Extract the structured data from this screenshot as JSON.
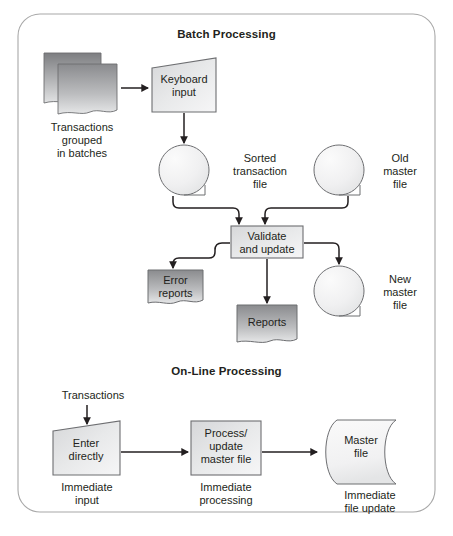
{
  "figure": {
    "frame": {
      "style": "rounded-rectangle-border",
      "border_color": "#a8a8a8"
    },
    "background": "#ffffff"
  },
  "sections": [
    {
      "id": "batch",
      "title": "Batch Processing"
    },
    {
      "id": "online",
      "title": "On-Line Processing"
    }
  ],
  "batch": {
    "transactions_stack": {
      "shape": "stacked-documents",
      "caption_line1": "Transactions",
      "caption_line2": "grouped",
      "caption_line3": "in batches"
    },
    "keyboard_input": {
      "shape": "manual-input-trapezoid",
      "line1": "Keyboard",
      "line2": "input"
    },
    "sorted_transaction_file": {
      "shape": "magnetic-tape",
      "label_line1": "Sorted",
      "label_line2": "transaction",
      "label_line3": "file"
    },
    "old_master_file": {
      "shape": "magnetic-tape",
      "label_line1": "Old",
      "label_line2": "master",
      "label_line3": "file"
    },
    "validate_and_update": {
      "shape": "process-rectangle",
      "line1": "Validate",
      "line2": "and update"
    },
    "error_reports": {
      "shape": "document",
      "line1": "Error",
      "line2": "reports"
    },
    "reports": {
      "shape": "document",
      "line1": "Reports"
    },
    "new_master_file": {
      "shape": "magnetic-tape",
      "label_line1": "New",
      "label_line2": "master",
      "label_line3": "file"
    }
  },
  "online": {
    "transactions_label": "Transactions",
    "enter_directly": {
      "shape": "manual-input-trapezoid",
      "line1": "Enter",
      "line2": "directly",
      "caption_line1": "Immediate",
      "caption_line2": "input"
    },
    "process_update": {
      "shape": "process-rectangle",
      "line1": "Process/",
      "line2": "update",
      "line3": "master file",
      "caption_line1": "Immediate",
      "caption_line2": "processing"
    },
    "master_file": {
      "shape": "direct-access-storage",
      "line1": "Master",
      "line2": "file",
      "caption_line1": "Immediate",
      "caption_line2": "file update"
    }
  },
  "colors": {
    "ink": "#231f20",
    "stroke": "#6d6e71",
    "frame": "#a8a8a8",
    "fill_dark_top": "#818285",
    "fill_dark_bottom": "#d9dadb",
    "fill_light_top": "#ededee",
    "fill_light_bottom": "#f7f7f8",
    "fill_mid_top": "#c7c8ca",
    "fill_mid_bottom": "#f1f1f2"
  }
}
